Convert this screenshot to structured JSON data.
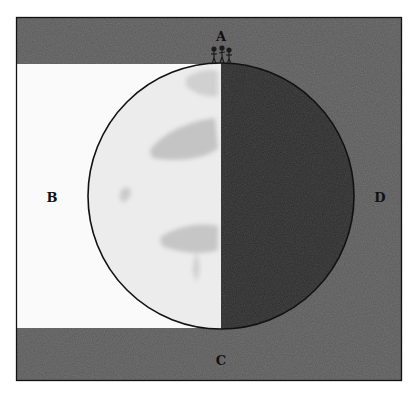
{
  "figure": {
    "colors": {
      "page_background": "#ffffff",
      "sky_dark": "#585858",
      "sky_dark_top_band": "#5a5a5a",
      "lit_region": "#fafafa",
      "globe_lit": "#ececec",
      "globe_shadow": "#2b2b2b",
      "globe_spots": "#c8c8c8",
      "outline": "#111111"
    },
    "frame": {
      "x": 16,
      "y": 17,
      "width": 386,
      "height": 364
    },
    "lit_band": {
      "x": 17,
      "y": 64,
      "width": 204,
      "height": 264
    },
    "globe": {
      "cx": 221,
      "cy": 196,
      "r": 133,
      "terminator_x": 221
    },
    "observers": {
      "count": 3,
      "x": 211,
      "y": 46,
      "width": 22,
      "height": 18
    }
  },
  "labels": {
    "top": "A",
    "left": "B",
    "bottom": "C",
    "right": "D"
  }
}
